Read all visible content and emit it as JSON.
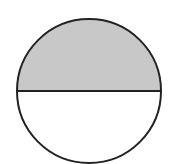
{
  "diagram": {
    "shape": "circle",
    "divided_by": "horizontal diameter",
    "parts_total": 2,
    "parts_shaded": 1,
    "shaded_fraction": 0.5,
    "shaded_part": "top",
    "colors": {
      "shaded_fill": "#c8c8c8",
      "unshaded_fill": "#ffffff",
      "stroke": "#222222"
    }
  }
}
